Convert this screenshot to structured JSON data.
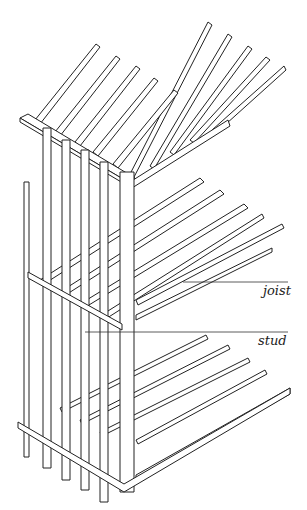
{
  "diagram": {
    "labels": [
      {
        "text": "joist",
        "x": 263,
        "y": 283
      },
      {
        "text": "stud",
        "x": 258,
        "y": 330
      }
    ],
    "colors": {
      "line": "#222222",
      "background": "#ffffff"
    }
  }
}
